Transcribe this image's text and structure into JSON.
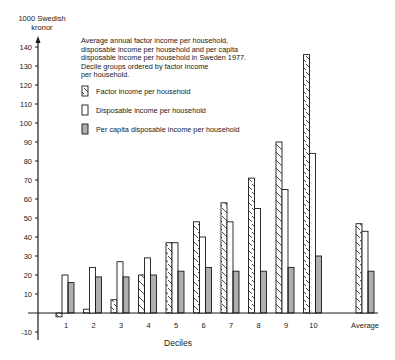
{
  "chart_data": {
    "type": "bar",
    "title_lines": [
      "Average annual factor income per household,",
      "disposable income per household and per capita",
      "disposable income per household in Sweden 1977.",
      "Decile groups ordered by factor income",
      "per household."
    ],
    "xlabel": "Deciles",
    "ylabel": "1000 Swedish kronor",
    "ylabel_lines": [
      "1000 Swedish",
      "kronor"
    ],
    "ylim": [
      -10,
      145
    ],
    "yticks": [
      -10,
      10,
      20,
      30,
      40,
      50,
      60,
      70,
      80,
      90,
      100,
      110,
      120,
      130,
      140
    ],
    "grid": false,
    "legend_position": "top-left inside plot",
    "categories": [
      "1",
      "2",
      "3",
      "4",
      "5",
      "6",
      "7",
      "8",
      "9",
      "10",
      "Average"
    ],
    "series": [
      {
        "name": "Factor income per household",
        "pattern": "diagonal-hatch",
        "values": [
          -2,
          2,
          7,
          20,
          37,
          48,
          58,
          71,
          90,
          136,
          47
        ]
      },
      {
        "name": "Disposable income per household",
        "pattern": "blank",
        "values": [
          20,
          24,
          27,
          29,
          37,
          40,
          48,
          55,
          65,
          84,
          43
        ]
      },
      {
        "name": "Per capita disposable income per household",
        "pattern": "horizontal-lines",
        "values": [
          16,
          19,
          19,
          20,
          22,
          24,
          22,
          22,
          24,
          30,
          22
        ]
      }
    ]
  },
  "colors": {
    "ink": "#1a1a1a",
    "background": "#ffffff"
  }
}
